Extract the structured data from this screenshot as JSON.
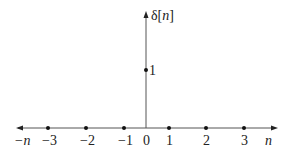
{
  "diagram": {
    "function_label_prefix": "δ[",
    "function_label_var": "n",
    "function_label_suffix": "]",
    "impulse_value_label": "1",
    "axis_end_left": "−n",
    "axis_end_right": "n",
    "ticks": [
      {
        "label": "−3",
        "x": 48
      },
      {
        "label": "−2",
        "x": 86
      },
      {
        "label": "−1",
        "x": 124
      },
      {
        "label": "0",
        "x": 146
      },
      {
        "label": "1",
        "x": 169
      },
      {
        "label": "2",
        "x": 206
      },
      {
        "label": "3",
        "x": 244
      }
    ],
    "colors": {
      "axis": "#555555",
      "dot": "#111111",
      "text": "#222222"
    }
  }
}
